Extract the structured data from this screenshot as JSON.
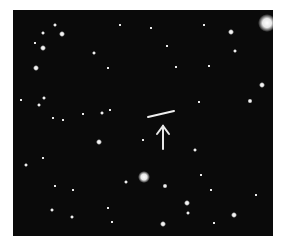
{
  "image": {
    "subject": "star field with moving object streak",
    "background_color": "#0a0a0a",
    "annotation": {
      "type": "arrow",
      "direction": "up",
      "color": "#e8e8e8"
    },
    "streak": {
      "x1": 135,
      "y1": 107,
      "x2": 161,
      "y2": 101
    }
  }
}
